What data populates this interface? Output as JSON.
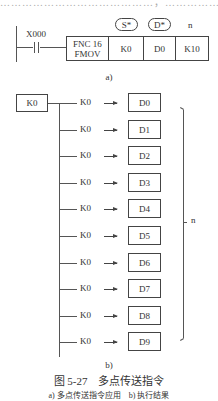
{
  "top_cut_text": "……………………………………，……………… ……………",
  "ladder": {
    "input_label": "X000",
    "function_box": {
      "line1": "FNC 16",
      "line2": "FMOV"
    },
    "operand_labels": {
      "source": "S*",
      "destination": "D*",
      "count": "n"
    },
    "operands": [
      "K0",
      "D0",
      "K10"
    ],
    "sublabel": "a)"
  },
  "result": {
    "source_box": "K0",
    "rows": [
      {
        "value": "K0",
        "target": "D0"
      },
      {
        "value": "K0",
        "target": "D1"
      },
      {
        "value": "K0",
        "target": "D2"
      },
      {
        "value": "K0",
        "target": "D3"
      },
      {
        "value": "K0",
        "target": "D4"
      },
      {
        "value": "K0",
        "target": "D5"
      },
      {
        "value": "K0",
        "target": "D6"
      },
      {
        "value": "K0",
        "target": "D7"
      },
      {
        "value": "K0",
        "target": "D8"
      },
      {
        "value": "K0",
        "target": "D9"
      }
    ],
    "brace_label": "n",
    "sublabel": "b)"
  },
  "caption": {
    "title": "图 5-27　多点传送指令",
    "subtitle": "a) 多点传送指令应用　b) 执行结果"
  }
}
